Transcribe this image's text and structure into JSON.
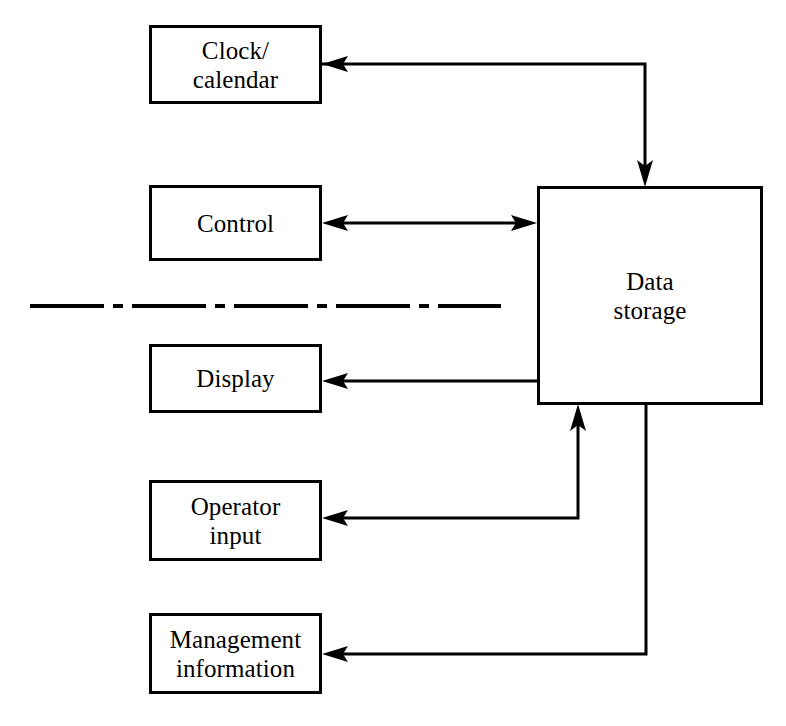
{
  "diagram": {
    "type": "block-diagram",
    "background_color": "#ffffff",
    "line_color": "#000000",
    "nodes": [
      {
        "id": "clock-calendar",
        "label": "Clock/\ncalendar",
        "x": 149,
        "y": 25,
        "width": 173,
        "height": 79
      },
      {
        "id": "control",
        "label": "Control",
        "x": 149,
        "y": 185,
        "width": 173,
        "height": 76
      },
      {
        "id": "display",
        "label": "Display",
        "x": 149,
        "y": 344,
        "width": 173,
        "height": 69
      },
      {
        "id": "operator-input",
        "label": "Operator\ninput",
        "x": 149,
        "y": 480,
        "width": 173,
        "height": 81
      },
      {
        "id": "management-information",
        "label": "Management\ninformation",
        "x": 149,
        "y": 613,
        "width": 173,
        "height": 81
      },
      {
        "id": "data-storage",
        "label": "Data\nstorage",
        "x": 537,
        "y": 186,
        "width": 226,
        "height": 219
      }
    ],
    "connectors": [
      {
        "id": "clock-to-storage",
        "from": "clock-calendar",
        "to": "data-storage",
        "direction": "bidirectional-ends",
        "arrowheads": [
          "left-at-clock",
          "down-at-storage-top"
        ],
        "path": "M322,64 L645,64 L645,186"
      },
      {
        "id": "control-to-storage",
        "from": "control",
        "to": "data-storage",
        "direction": "bidirectional",
        "arrowheads": [
          "left-at-control",
          "right-at-storage"
        ],
        "path": "M322,223 L537,223"
      },
      {
        "id": "storage-to-display",
        "from": "data-storage",
        "to": "display",
        "direction": "to-display",
        "arrowheads": [
          "left-at-display"
        ],
        "path": "M537,381 L322,381"
      },
      {
        "id": "operator-input-to-storage",
        "from": "operator-input",
        "to": "data-storage",
        "direction": "bidirectional-ends",
        "arrowheads": [
          "left-at-operator-input",
          "up-at-storage-bottom"
        ],
        "path": "M322,518 L578,518 L578,405"
      },
      {
        "id": "storage-to-management",
        "from": "data-storage",
        "to": "management-information",
        "direction": "to-management",
        "arrowheads": [
          "left-at-management"
        ],
        "path": "M646,405 L646,654 L322,654"
      }
    ],
    "separator": {
      "id": "section-divider",
      "style": "dash-dot",
      "x1": 30,
      "x2": 501,
      "y": 306,
      "dash_pattern": "74 9 10 9"
    }
  }
}
